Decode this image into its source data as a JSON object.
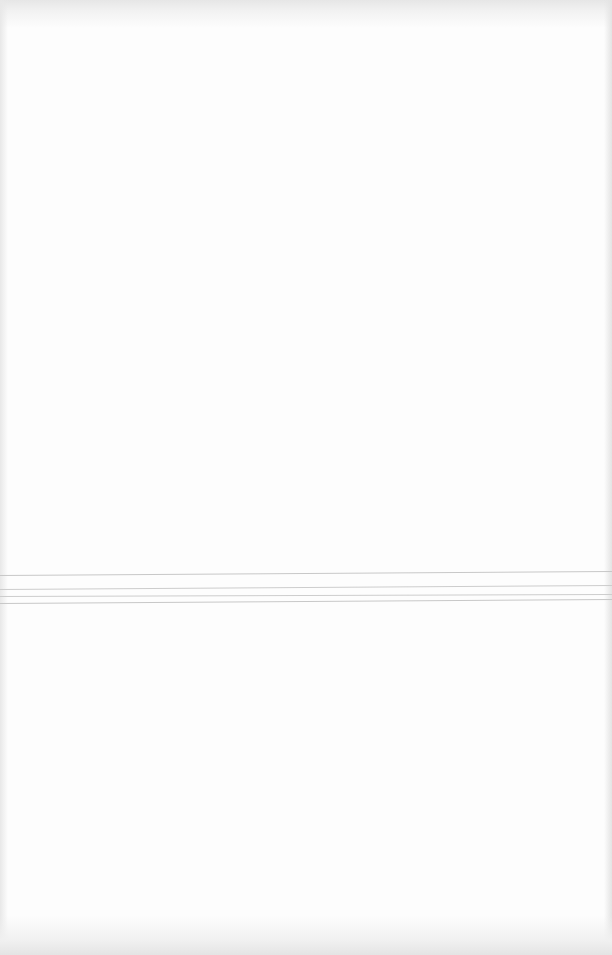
{
  "page": {
    "background_color": "#fdfdfd",
    "content_text": "",
    "rules": [
      {
        "y_left": 575,
        "y_right": 571,
        "color": "#c8c8c8"
      },
      {
        "y_left": 589,
        "y_right": 585,
        "color": "#cdcdcd"
      },
      {
        "y_left": 596,
        "y_right": 594,
        "color": "#cdcdcd"
      },
      {
        "y_left": 603,
        "y_right": 599,
        "color": "#c8c8c8"
      }
    ]
  }
}
